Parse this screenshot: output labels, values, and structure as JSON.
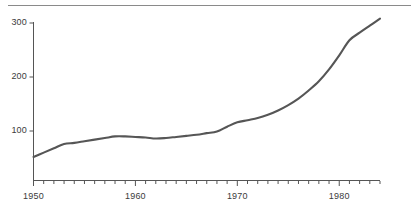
{
  "figure": {
    "background_color": "#ffffff",
    "rule_color": "#8a8a8a",
    "axis_color": "#555555",
    "line_color": "#565656",
    "text_color": "#3b3b3b"
  },
  "chart_data": {
    "type": "line",
    "title": "",
    "subtitle": "",
    "xlabel": "",
    "ylabel": "",
    "xlim": [
      1950,
      1984
    ],
    "ylim": [
      0,
      320
    ],
    "grid": false,
    "legend": false,
    "legend_position": "none",
    "yticks": [
      100,
      200,
      300
    ],
    "ytick_labels": [
      "100",
      "200",
      "300"
    ],
    "xticks": [
      1950,
      1960,
      1970,
      1980
    ],
    "xtick_labels": [
      "1950",
      "1960",
      "1970",
      "1980"
    ],
    "xminor_tick_interval": 1,
    "series": [
      {
        "name": "series-1",
        "color": "#565656",
        "x": [
          1950,
          1951,
          1952,
          1953,
          1954,
          1955,
          1956,
          1957,
          1958,
          1959,
          1960,
          1961,
          1962,
          1963,
          1964,
          1965,
          1966,
          1967,
          1968,
          1969,
          1970,
          1971,
          1972,
          1973,
          1974,
          1975,
          1976,
          1977,
          1978,
          1979,
          1980,
          1981,
          1982,
          1983,
          1984
        ],
        "values": [
          52,
          60,
          68,
          76,
          78,
          81,
          84,
          87,
          90,
          90,
          89,
          88,
          86,
          87,
          89,
          91,
          93,
          96,
          99,
          108,
          116,
          120,
          124,
          130,
          138,
          148,
          160,
          175,
          192,
          214,
          240,
          268,
          282,
          295,
          308
        ]
      }
    ]
  }
}
